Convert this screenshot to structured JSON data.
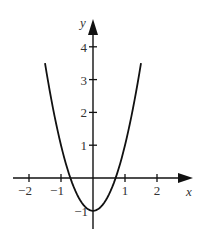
{
  "chart_data": {
    "type": "line",
    "title": "",
    "function": "y = 2x^2 - 1",
    "xlabel": "x",
    "ylabel": "y",
    "xlim": [
      -2.5,
      3.1
    ],
    "ylim": [
      -1.6,
      4.9
    ],
    "grid": false,
    "legend": null,
    "x_ticks": [
      -2,
      -1,
      1,
      2
    ],
    "x_tick_labels": [
      "−2",
      "−1",
      "1",
      "2"
    ],
    "y_ticks": [
      -1,
      1,
      2,
      3,
      4
    ],
    "y_tick_labels": [
      "−1",
      "1",
      "2",
      "3",
      "4"
    ],
    "series": [
      {
        "name": "parabola",
        "x": [
          -1.5,
          -1.25,
          -1.0,
          -0.75,
          -0.5,
          -0.25,
          0,
          0.25,
          0.5,
          0.75,
          1.0,
          1.25,
          1.5
        ],
        "y": [
          3.5,
          2.125,
          1.0,
          0.125,
          -0.5,
          -0.875,
          -1.0,
          -0.875,
          -0.5,
          0.125,
          1.0,
          2.125,
          3.5
        ]
      }
    ],
    "roots": [
      -0.707,
      0.707
    ],
    "vertex": [
      0,
      -1
    ]
  },
  "colors": {
    "curve": "#111111",
    "axis": "#111111",
    "text": "#333333"
  }
}
